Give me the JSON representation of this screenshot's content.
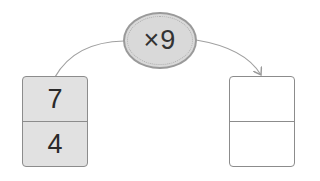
{
  "operator": {
    "label": "×9"
  },
  "input_box": {
    "top": "7",
    "bottom": "4"
  },
  "output_box": {
    "top": "",
    "bottom": ""
  },
  "colors": {
    "filled": "#e1e1e1",
    "border": "#8c8c8c",
    "operator_fill": "#d9d9d9",
    "arrow": "#9a9a9a"
  }
}
